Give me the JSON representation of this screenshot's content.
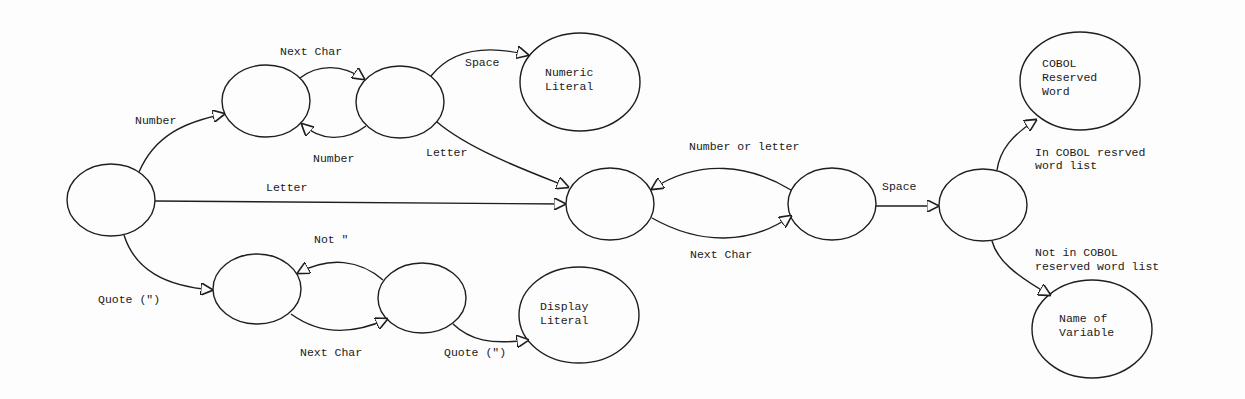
{
  "diagram": {
    "states": [
      {
        "id": "start",
        "label": ""
      },
      {
        "id": "num_a",
        "label": ""
      },
      {
        "id": "num_b",
        "label": ""
      },
      {
        "id": "numeric_literal",
        "lines": [
          "Numeric",
          "Literal"
        ]
      },
      {
        "id": "word_a",
        "label": ""
      },
      {
        "id": "word_b",
        "label": ""
      },
      {
        "id": "word_end",
        "label": ""
      },
      {
        "id": "cobol_reserved",
        "lines": [
          "COBOL",
          "Reserved",
          "Word"
        ]
      },
      {
        "id": "name_of_variable",
        "lines": [
          "Name of",
          "Variable"
        ]
      },
      {
        "id": "quote_a",
        "label": ""
      },
      {
        "id": "quote_b",
        "label": ""
      },
      {
        "id": "display_literal",
        "lines": [
          "Display",
          "Literal"
        ]
      }
    ],
    "transitions": {
      "start_to_num": "Number",
      "num_a_to_b": "Next Char",
      "num_b_to_a": "Number",
      "num_b_to_literal": "Space",
      "num_b_to_word": "Letter",
      "start_to_word": "Letter",
      "start_to_quote": "Quote (\")",
      "quote_b_to_a": "Not \"",
      "quote_a_to_b": "Next Char",
      "quote_b_to_display": "Quote (\")",
      "word_b_to_a": "Number or letter",
      "word_a_to_b": "Next Char",
      "word_b_to_end": "Space",
      "end_to_reserved": [
        "In COBOL resrved",
        "word list"
      ],
      "end_to_variable": [
        "Not in COBOL",
        "reserved word list"
      ]
    }
  }
}
